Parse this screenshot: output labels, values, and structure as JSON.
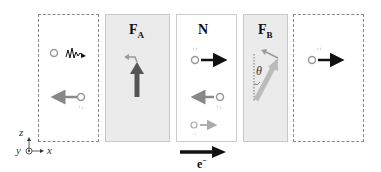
{
  "diagram": {
    "panels": [
      {
        "id": "left-lead",
        "style": "dashed",
        "label": ""
      },
      {
        "id": "FA",
        "style": "shaded",
        "label": "F",
        "sub": "A"
      },
      {
        "id": "N",
        "style": "solid",
        "label": "N"
      },
      {
        "id": "FB",
        "style": "shaded",
        "label": "F",
        "sub": "B"
      },
      {
        "id": "right-lead",
        "style": "dashed",
        "label": ""
      }
    ],
    "FA_label": "F",
    "FA_sub": "A",
    "N_label": "N",
    "FB_label": "F",
    "FB_sub": "B",
    "theta_label": "θ",
    "electron_label": "e",
    "electron_sup": "−",
    "axes": {
      "z": "z",
      "y": "y",
      "x": "x"
    },
    "spin_labels": [
      "↑↑",
      "↓↓",
      "↑↑",
      "↓↓",
      "↓↓",
      "↑↑"
    ],
    "colors": {
      "panel_shaded": "#ebebeb",
      "arrow_dark": "#111111",
      "arrow_gray": "#888888",
      "arrow_fa": "#555555",
      "arrow_fb": "#bbbbbb"
    }
  }
}
